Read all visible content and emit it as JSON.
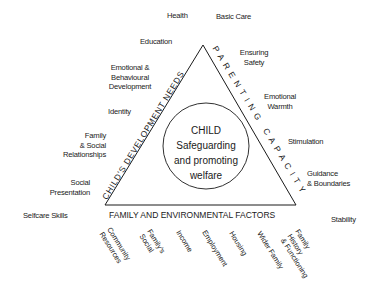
{
  "diagram": {
    "center": {
      "title": "CHILD",
      "line1": "Safeguarding",
      "line2": "and promoting",
      "line3": "welfare"
    },
    "sides": {
      "left": "CHILD'S DEVELOPMENT NEEDS",
      "right": "PARENTING CAPACITY",
      "bottom": "FAMILY AND ENVIRONMENTAL FACTORS"
    },
    "development_needs": [
      "Health",
      "Education",
      "Emotional &\nBehavioural\nDevelopment",
      "Identity",
      "Family\n& Social\nRelationships",
      "Social\nPresentation",
      "Selfcare Skills"
    ],
    "parenting_capacity": [
      "Basic Care",
      "Ensuring\nSafety",
      "Emotional\nWarmth",
      "Stimulation",
      "Guidance\n& Boundaries",
      "Stability"
    ],
    "family_environmental_factors": [
      "Community\nResources",
      "Family's\nSocial",
      "Income",
      "Employment",
      "Housing",
      "Wider Family",
      "Family\nHistory\n& Functioning"
    ]
  }
}
